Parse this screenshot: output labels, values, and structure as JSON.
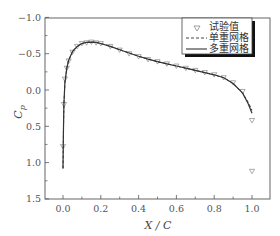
{
  "chart_data": {
    "type": "line",
    "title": "",
    "xlabel": "X / C",
    "ylabel": "C_p",
    "xlim": [
      -0.08,
      1.08
    ],
    "ylim": [
      1.5,
      -1.0
    ],
    "y_inverted": true,
    "grid": false,
    "legend_position": "upper right",
    "x_ticks": [
      0.0,
      0.2,
      0.4,
      0.6,
      0.8,
      1.0
    ],
    "x_tick_labels": [
      "0.0",
      "0.2",
      "0.4",
      "0.6",
      "0.8",
      "1.0"
    ],
    "y_ticks": [
      -1.0,
      -0.5,
      0.0,
      0.5,
      1.0,
      1.5
    ],
    "y_tick_labels": [
      "−1.0",
      "−0.5",
      "0.0",
      "0.5",
      "1.0",
      "1.5"
    ],
    "series": [
      {
        "name": "试验值",
        "style": "markers-triangle-down",
        "x": [
          0.0,
          0.005,
          0.01,
          0.02,
          0.03,
          0.05,
          0.075,
          0.1,
          0.125,
          0.15,
          0.175,
          0.2,
          0.25,
          0.3,
          0.35,
          0.4,
          0.45,
          0.5,
          0.55,
          0.6,
          0.65,
          0.7,
          0.75,
          0.8,
          0.85,
          0.9,
          0.95,
          1.0,
          1.0
        ],
        "y": [
          0.78,
          0.2,
          -0.15,
          -0.3,
          -0.4,
          -0.52,
          -0.6,
          -0.64,
          -0.65,
          -0.66,
          -0.65,
          -0.64,
          -0.6,
          -0.55,
          -0.5,
          -0.46,
          -0.42,
          -0.39,
          -0.36,
          -0.33,
          -0.3,
          -0.27,
          -0.24,
          -0.21,
          -0.17,
          -0.1,
          0.02,
          0.42,
          1.12
        ]
      },
      {
        "name": "单重网格",
        "style": "dashed",
        "x": [
          0.0,
          0.002,
          0.005,
          0.01,
          0.02,
          0.03,
          0.05,
          0.075,
          0.1,
          0.125,
          0.15,
          0.175,
          0.2,
          0.25,
          0.3,
          0.35,
          0.4,
          0.45,
          0.5,
          0.55,
          0.6,
          0.65,
          0.7,
          0.75,
          0.8,
          0.85,
          0.9,
          0.95,
          0.98,
          1.0
        ],
        "y": [
          1.08,
          0.6,
          0.2,
          -0.1,
          -0.3,
          -0.41,
          -0.53,
          -0.6,
          -0.64,
          -0.655,
          -0.66,
          -0.655,
          -0.64,
          -0.6,
          -0.555,
          -0.51,
          -0.465,
          -0.425,
          -0.39,
          -0.36,
          -0.33,
          -0.3,
          -0.27,
          -0.24,
          -0.21,
          -0.17,
          -0.09,
          0.04,
          0.17,
          0.28
        ]
      },
      {
        "name": "多重网格",
        "style": "solid",
        "x": [
          0.0,
          0.002,
          0.005,
          0.01,
          0.02,
          0.03,
          0.05,
          0.075,
          0.1,
          0.125,
          0.15,
          0.175,
          0.2,
          0.25,
          0.3,
          0.35,
          0.4,
          0.45,
          0.5,
          0.55,
          0.6,
          0.65,
          0.7,
          0.75,
          0.8,
          0.85,
          0.9,
          0.95,
          0.98,
          1.0
        ],
        "y": [
          1.08,
          0.6,
          0.2,
          -0.1,
          -0.3,
          -0.41,
          -0.53,
          -0.6,
          -0.64,
          -0.655,
          -0.66,
          -0.655,
          -0.64,
          -0.6,
          -0.555,
          -0.51,
          -0.465,
          -0.425,
          -0.39,
          -0.36,
          -0.33,
          -0.3,
          -0.27,
          -0.24,
          -0.21,
          -0.17,
          -0.09,
          0.04,
          0.19,
          0.32
        ]
      }
    ],
    "legend": [
      {
        "label": "试验值",
        "symbol": "▽"
      },
      {
        "label": "单重网格",
        "symbol": "dashed-line"
      },
      {
        "label": "多重网格",
        "symbol": "solid-line"
      }
    ]
  },
  "axes": {
    "xlabel": "X / C",
    "ylabel_main": "C",
    "ylabel_sub": "p"
  },
  "legend": {
    "items": [
      {
        "label": "试验值"
      },
      {
        "label": "单重网格"
      },
      {
        "label": "多重网格"
      }
    ]
  },
  "colors": {
    "line": "#333333",
    "marker": "#888888",
    "axis": "#555555",
    "background": "#ffffff"
  }
}
